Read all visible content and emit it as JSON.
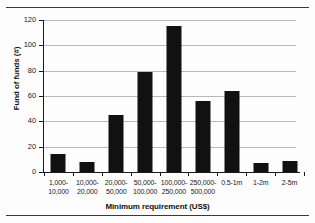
{
  "figure": {
    "top_rule": "",
    "bottom_rule": ""
  },
  "chart_data": {
    "type": "bar",
    "title": "",
    "subtitle": "",
    "categories": [
      "1,000-\n10,000",
      "10,000-\n20,000",
      "20,000-\n50,000",
      "50,000-\n100,000",
      "100,000-\n250,000",
      "250,000-\n500,000",
      "0.5-1m",
      "1-2m",
      "2-5m"
    ],
    "values": [
      14,
      8,
      45,
      79,
      115,
      56,
      64,
      7,
      9
    ],
    "xlabel": "Minimum requirement (US$)",
    "ylabel": "Fund of funds (#)",
    "ylim": [
      0,
      120
    ],
    "ytick_labels": [
      "0",
      "20",
      "40",
      "60",
      "80",
      "100",
      "120"
    ],
    "ytick_values": [
      0,
      20,
      40,
      60,
      80,
      100,
      120
    ],
    "grid": true,
    "grid_axis": "y",
    "legend": false,
    "legend_position": "none",
    "bar_color": "#111111",
    "grid_color": "#b9b9b9",
    "axis_color": "#1a1a1a"
  }
}
